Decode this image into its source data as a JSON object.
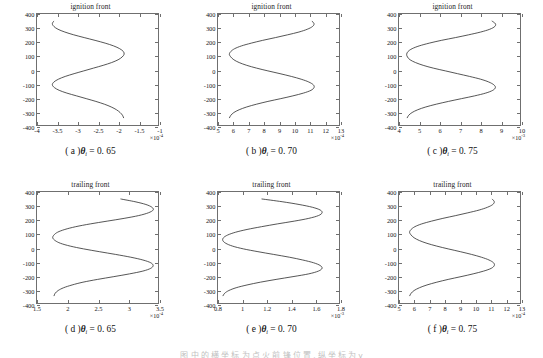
{
  "figure": {
    "panel_count": 6,
    "footnote": "图 中 的 横 坐 标 为 点 火 前 锋 位 置 , 纵 坐 标 为 y"
  },
  "chart_data": [
    {
      "type": "line",
      "panel": "a",
      "title": "ignition front",
      "caption_label": "( a )",
      "caption_symbol": "θ",
      "caption_subscript": "i",
      "caption_value": "= 0. 65",
      "xlabel": "",
      "ylabel": "",
      "x_exponent": "×10",
      "x_exponent_power": "-4",
      "xlim": [
        -4,
        -1
      ],
      "ylim": [
        -400,
        400
      ],
      "xticks": [
        -4,
        -3.5,
        -3,
        -2.5,
        -2,
        -1.5,
        -1
      ],
      "xticklabels": [
        "-4",
        "-3.5",
        "-3",
        "-2.5",
        "-2",
        "-1.5",
        "-1"
      ],
      "yticks": [
        -400,
        -300,
        -200,
        -100,
        0,
        100,
        200,
        300,
        400
      ],
      "yticklabels": [
        "-400",
        "-300",
        "-200",
        "-100",
        "0",
        "100",
        "200",
        "300",
        "400"
      ],
      "grid": false,
      "mirrored": true,
      "series": [
        {
          "name": "ignition front 0.65",
          "y": [
            -350,
            -330,
            -310,
            -290,
            -270,
            -250,
            -230,
            -210,
            -190,
            -170,
            -150,
            -130,
            -110,
            -90,
            -70,
            -50,
            -30,
            -10,
            10,
            30,
            50,
            70,
            90,
            110,
            130,
            150,
            170,
            190,
            210,
            230,
            250,
            270,
            290,
            310,
            330,
            350
          ],
          "x": [
            -1.85,
            -1.88,
            -1.94,
            -2.03,
            -2.16,
            -2.33,
            -2.54,
            -2.78,
            -3.02,
            -3.26,
            -3.45,
            -3.57,
            -3.62,
            -3.58,
            -3.47,
            -3.3,
            -3.08,
            -2.84,
            -2.6,
            -2.36,
            -2.15,
            -1.99,
            -1.89,
            -1.84,
            -1.86,
            -1.95,
            -2.1,
            -2.31,
            -2.56,
            -2.83,
            -3.09,
            -3.31,
            -3.48,
            -3.58,
            -3.62,
            -3.58
          ]
        }
      ]
    },
    {
      "type": "line",
      "panel": "b",
      "title": "ignition front",
      "caption_label": "( b )",
      "caption_symbol": "θ",
      "caption_subscript": "i",
      "caption_value": "= 0. 70",
      "xlabel": "",
      "ylabel": "",
      "x_exponent": "×10",
      "x_exponent_power": "-4",
      "xlim": [
        5,
        13
      ],
      "ylim": [
        -400,
        400
      ],
      "xticks": [
        5,
        6,
        7,
        8,
        9,
        10,
        11,
        12,
        13
      ],
      "xticklabels": [
        "5",
        "6",
        "7",
        "8",
        "9",
        "10",
        "11",
        "12",
        "13"
      ],
      "yticks": [
        -400,
        -300,
        -200,
        -100,
        0,
        100,
        200,
        300,
        400
      ],
      "yticklabels": [
        "-400",
        "-300",
        "-200",
        "-100",
        "0",
        "100",
        "200",
        "300",
        "400"
      ],
      "grid": false,
      "mirrored": false,
      "series": [
        {
          "name": "ignition front 0.70",
          "y": [
            -350,
            -330,
            -310,
            -290,
            -270,
            -250,
            -230,
            -210,
            -190,
            -170,
            -150,
            -130,
            -110,
            -90,
            -70,
            -50,
            -30,
            -10,
            10,
            30,
            50,
            70,
            90,
            110,
            130,
            150,
            170,
            190,
            210,
            230,
            250,
            270,
            290,
            310,
            330,
            350
          ],
          "x": [
            5.75,
            5.85,
            6.05,
            6.4,
            6.9,
            7.55,
            8.3,
            9.15,
            9.95,
            10.65,
            11.15,
            11.35,
            11.3,
            11.0,
            10.5,
            9.85,
            9.1,
            8.3,
            7.55,
            6.9,
            6.4,
            6.05,
            5.85,
            5.75,
            5.85,
            6.1,
            6.55,
            7.2,
            7.95,
            8.8,
            9.6,
            10.35,
            10.9,
            11.25,
            11.35,
            11.2
          ]
        }
      ]
    },
    {
      "type": "line",
      "panel": "c",
      "title": "ignition front",
      "caption_label": "( c )",
      "caption_symbol": "θ",
      "caption_subscript": "i",
      "caption_value": "= 0. 75",
      "xlabel": "",
      "ylabel": "",
      "x_exponent": "×10",
      "x_exponent_power": "-3",
      "xlim": [
        4,
        10
      ],
      "ylim": [
        -400,
        400
      ],
      "xticks": [
        4,
        5,
        6,
        7,
        8,
        9,
        10
      ],
      "xticklabels": [
        "4",
        "5",
        "6",
        "7",
        "8",
        "9",
        "10"
      ],
      "yticks": [
        -400,
        -300,
        -200,
        -100,
        0,
        100,
        200,
        300,
        400
      ],
      "yticklabels": [
        "-400",
        "-300",
        "-200",
        "-100",
        "0",
        "100",
        "200",
        "300",
        "400"
      ],
      "grid": false,
      "mirrored": false,
      "series": [
        {
          "name": "ignition front 0.75",
          "y": [
            -350,
            -330,
            -310,
            -290,
            -270,
            -250,
            -230,
            -210,
            -190,
            -170,
            -150,
            -130,
            -110,
            -90,
            -70,
            -50,
            -30,
            -10,
            10,
            30,
            50,
            70,
            90,
            110,
            130,
            150,
            170,
            190,
            210,
            230,
            250,
            270,
            290,
            310,
            330,
            350
          ],
          "x": [
            4.4,
            4.48,
            4.65,
            4.93,
            5.33,
            5.85,
            6.45,
            7.1,
            7.75,
            8.3,
            8.65,
            8.78,
            8.7,
            8.45,
            8.05,
            7.5,
            6.9,
            6.3,
            5.7,
            5.2,
            4.82,
            4.55,
            4.42,
            4.38,
            4.45,
            4.65,
            5.0,
            5.5,
            6.1,
            6.8,
            7.45,
            8.05,
            8.5,
            8.75,
            8.78,
            8.6
          ]
        }
      ]
    },
    {
      "type": "line",
      "panel": "d",
      "title": "trailing front",
      "caption_label": "( d )",
      "caption_symbol": "θ",
      "caption_subscript": "i",
      "caption_value": "= 0. 65",
      "xlabel": "",
      "ylabel": "",
      "x_exponent": "×10",
      "x_exponent_power": "-4",
      "xlim": [
        1.5,
        3.5
      ],
      "ylim": [
        -400,
        400
      ],
      "xticks": [
        1.5,
        2,
        2.5,
        3,
        3.5
      ],
      "xticklabels": [
        "1.5",
        "2",
        "2.5",
        "3",
        "3.5"
      ],
      "yticks": [
        -400,
        -300,
        -200,
        -100,
        0,
        100,
        200,
        300,
        400
      ],
      "yticklabels": [
        "-400",
        "-300",
        "-200",
        "-100",
        "0",
        "100",
        "200",
        "300",
        "400"
      ],
      "grid": false,
      "mirrored": false,
      "series": [
        {
          "name": "trailing front 0.65",
          "y": [
            -350,
            -330,
            -310,
            -290,
            -270,
            -250,
            -230,
            -210,
            -190,
            -170,
            -150,
            -130,
            -110,
            -90,
            -70,
            -50,
            -30,
            -10,
            10,
            30,
            50,
            70,
            90,
            110,
            130,
            150,
            170,
            190,
            210,
            230,
            250,
            270,
            290,
            310,
            330,
            350
          ],
          "x": [
            1.78,
            1.8,
            1.85,
            1.94,
            2.08,
            2.26,
            2.5,
            2.77,
            3.03,
            3.25,
            3.38,
            3.42,
            3.38,
            3.25,
            3.05,
            2.8,
            2.53,
            2.27,
            2.05,
            1.89,
            1.8,
            1.76,
            1.78,
            1.84,
            1.96,
            2.14,
            2.38,
            2.66,
            2.94,
            3.18,
            3.34,
            3.42,
            3.4,
            3.3,
            3.12,
            2.88
          ]
        }
      ]
    },
    {
      "type": "line",
      "panel": "e",
      "title": "trailing front",
      "caption_label": "( e )",
      "caption_symbol": "θ",
      "caption_subscript": "i",
      "caption_value": "= 0. 70",
      "xlabel": "",
      "ylabel": "",
      "x_exponent": "×10",
      "x_exponent_power": "-3",
      "xlim": [
        0.8,
        1.8
      ],
      "ylim": [
        -400,
        400
      ],
      "xticks": [
        0.8,
        1,
        1.2,
        1.4,
        1.6,
        1.8
      ],
      "xticklabels": [
        "0.8",
        "1",
        "1.2",
        "1.4",
        "1.6",
        "1.8"
      ],
      "yticks": [
        -400,
        -300,
        -200,
        -100,
        0,
        100,
        200,
        300,
        400
      ],
      "yticklabels": [
        "-400",
        "-300",
        "-200",
        "-100",
        "0",
        "100",
        "200",
        "300",
        "400"
      ],
      "grid": false,
      "mirrored": false,
      "series": [
        {
          "name": "trailing front 0.70",
          "y": [
            -350,
            -330,
            -310,
            -290,
            -270,
            -250,
            -230,
            -210,
            -190,
            -170,
            -150,
            -130,
            -110,
            -90,
            -70,
            -50,
            -30,
            -10,
            10,
            30,
            50,
            70,
            90,
            110,
            130,
            150,
            170,
            190,
            210,
            230,
            250,
            270,
            290,
            310,
            330,
            350
          ],
          "x": [
            0.84,
            0.855,
            0.89,
            0.95,
            1.04,
            1.15,
            1.28,
            1.42,
            1.55,
            1.63,
            1.66,
            1.645,
            1.59,
            1.5,
            1.39,
            1.26,
            1.13,
            1.01,
            0.92,
            0.865,
            0.84,
            0.845,
            0.88,
            0.945,
            1.04,
            1.16,
            1.29,
            1.43,
            1.55,
            1.63,
            1.66,
            1.645,
            1.58,
            1.47,
            1.33,
            1.16
          ]
        }
      ]
    },
    {
      "type": "line",
      "panel": "f",
      "title": "trailing front",
      "caption_label": "( f )",
      "caption_symbol": "θ",
      "caption_subscript": "i",
      "caption_value": "= 0. 75",
      "xlabel": "",
      "ylabel": "",
      "x_exponent": "×10",
      "x_exponent_power": "-4",
      "xlim": [
        5,
        13
      ],
      "ylim": [
        -400,
        400
      ],
      "xticks": [
        5,
        6,
        7,
        8,
        9,
        10,
        11,
        12,
        13
      ],
      "xticklabels": [
        "5",
        "6",
        "7",
        "8",
        "9",
        "10",
        "11",
        "12",
        "13"
      ],
      "yticks": [
        -400,
        -300,
        -200,
        -100,
        0,
        100,
        200,
        300,
        400
      ],
      "yticklabels": [
        "-400",
        "-300",
        "-200",
        "-100",
        "0",
        "100",
        "200",
        "300",
        "400"
      ],
      "grid": false,
      "mirrored": false,
      "series": [
        {
          "name": "trailing front 0.75",
          "y": [
            -350,
            -330,
            -310,
            -290,
            -270,
            -250,
            -230,
            -210,
            -190,
            -170,
            -150,
            -130,
            -110,
            -90,
            -70,
            -50,
            -30,
            -10,
            10,
            30,
            50,
            70,
            90,
            110,
            130,
            150,
            170,
            190,
            210,
            230,
            250,
            270,
            290,
            310,
            330,
            350
          ],
          "x": [
            5.7,
            5.8,
            6.0,
            6.35,
            6.85,
            7.5,
            8.25,
            9.1,
            9.9,
            10.6,
            11.1,
            11.3,
            11.25,
            10.95,
            10.45,
            9.8,
            9.05,
            8.25,
            7.5,
            6.85,
            6.35,
            6.0,
            5.8,
            5.7,
            5.8,
            6.05,
            6.5,
            7.15,
            7.9,
            8.75,
            9.55,
            10.3,
            10.85,
            11.2,
            11.3,
            11.15
          ]
        }
      ]
    }
  ]
}
